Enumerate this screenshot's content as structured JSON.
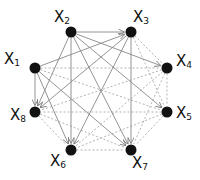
{
  "diagram": {
    "title": "",
    "nodes": [
      {
        "id": "x1",
        "label": "X",
        "sub": "1",
        "x": 35,
        "y": 68,
        "lx": 4,
        "ly": 52
      },
      {
        "id": "x2",
        "label": "X",
        "sub": "2",
        "x": 71,
        "y": 32,
        "lx": 54,
        "ly": 10
      },
      {
        "id": "x3",
        "label": "X",
        "sub": "3",
        "x": 131,
        "y": 32,
        "lx": 133,
        "ly": 10
      },
      {
        "id": "x4",
        "label": "X",
        "sub": "4",
        "x": 167,
        "y": 68,
        "lx": 176,
        "ly": 54
      },
      {
        "id": "x5",
        "label": "X",
        "sub": "5",
        "x": 167,
        "y": 112,
        "lx": 176,
        "ly": 106
      },
      {
        "id": "x6",
        "label": "X",
        "sub": "6",
        "x": 71,
        "y": 150,
        "lx": 50,
        "ly": 154
      },
      {
        "id": "x7",
        "label": "X",
        "sub": "7",
        "x": 131,
        "y": 150,
        "lx": 132,
        "ly": 156
      },
      {
        "id": "x8",
        "label": "X",
        "sub": "8",
        "x": 35,
        "y": 112,
        "lx": 10,
        "ly": 108
      }
    ],
    "solid_edges": [
      [
        "x2",
        "x3"
      ],
      [
        "x2",
        "x4"
      ],
      [
        "x2",
        "x5"
      ],
      [
        "x2",
        "x6"
      ],
      [
        "x2",
        "x7"
      ],
      [
        "x2",
        "x8"
      ],
      [
        "x1",
        "x3"
      ],
      [
        "x1",
        "x8"
      ],
      [
        "x1",
        "x6"
      ],
      [
        "x1",
        "x7"
      ],
      [
        "x3",
        "x8"
      ],
      [
        "x3",
        "x6"
      ],
      [
        "x3",
        "x7"
      ]
    ],
    "dashed_edges": [
      [
        "x1",
        "x4"
      ],
      [
        "x1",
        "x5"
      ],
      [
        "x3",
        "x4"
      ],
      [
        "x3",
        "x5"
      ],
      [
        "x4",
        "x5"
      ],
      [
        "x4",
        "x6"
      ],
      [
        "x4",
        "x7"
      ],
      [
        "x4",
        "x8"
      ],
      [
        "x5",
        "x6"
      ],
      [
        "x5",
        "x7"
      ],
      [
        "x5",
        "x8"
      ],
      [
        "x6",
        "x7"
      ],
      [
        "x8",
        "x6"
      ],
      [
        "x8",
        "x7"
      ]
    ],
    "colors": {
      "node": "#111111",
      "solid": "#888888",
      "dashed": "#aaaaaa"
    }
  }
}
